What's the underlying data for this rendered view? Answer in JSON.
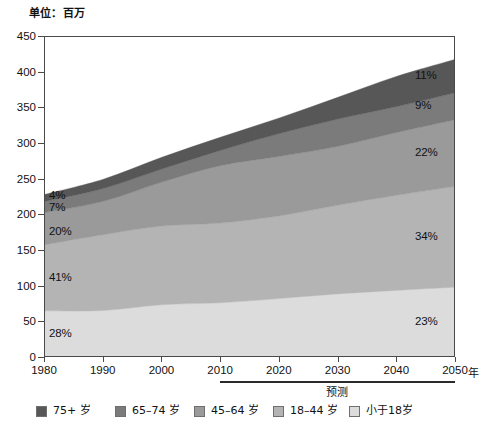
{
  "caption": {
    "unit_label": "单位：百万"
  },
  "axis": {
    "x_unit_suffix": "年",
    "y_ticks": [
      "0",
      "50",
      "100",
      "150",
      "200",
      "250",
      "300",
      "350",
      "400",
      "450"
    ],
    "x_ticks": [
      "1980",
      "1990",
      "2000",
      "2010",
      "2020",
      "2030",
      "2040",
      "2050"
    ]
  },
  "forecast": {
    "label": "预测",
    "start_year": 2010,
    "end_year": 2050
  },
  "annotations": {
    "left_1980": [
      {
        "text": "4%",
        "series": "75+ 岁"
      },
      {
        "text": "7%",
        "series": "65–74 岁"
      },
      {
        "text": "20%",
        "series": "45–64 岁"
      },
      {
        "text": "41%",
        "series": "18–44 岁"
      },
      {
        "text": "28%",
        "series": "小于18岁"
      }
    ],
    "right_2050": [
      {
        "text": "11%",
        "series": "75+ 岁"
      },
      {
        "text": "9%",
        "series": "65–74 岁"
      },
      {
        "text": "22%",
        "series": "45–64 岁"
      },
      {
        "text": "34%",
        "series": "18–44 岁"
      },
      {
        "text": "23%",
        "series": "小于18岁"
      }
    ]
  },
  "legend": {
    "items": [
      {
        "label": "75+ 岁",
        "color": "#575757",
        "wrap": false
      },
      {
        "label": "65–74 岁",
        "color": "#7b7b7b",
        "wrap": true
      },
      {
        "label": "45–64 岁",
        "color": "#9a9a9a",
        "wrap": true
      },
      {
        "label": "18–44 岁",
        "color": "#b4b4b4",
        "wrap": true
      },
      {
        "label": "小于18岁",
        "color": "#dcdcdc",
        "wrap": false
      }
    ]
  },
  "chart_data": {
    "type": "area",
    "title": "",
    "subtitle": "",
    "xlabel": "年",
    "ylabel": "单位：百万",
    "ylim": [
      0,
      450
    ],
    "xlim": [
      1980,
      2050
    ],
    "grid": false,
    "stacked": true,
    "legend_position": "bottom",
    "x": [
      1980,
      1990,
      2000,
      2010,
      2020,
      2030,
      2040,
      2050
    ],
    "series": [
      {
        "name": "小于18岁",
        "color": "#dcdcdc",
        "values": [
          63.7,
          64.2,
          72.3,
          75.0,
          81.0,
          87.5,
          92.5,
          97.0
        ]
      },
      {
        "name": "18–44 岁",
        "color": "#b4b4b4",
        "values": [
          93.3,
          107.0,
          111.0,
          112.5,
          116.5,
          125.0,
          134.0,
          142.0
        ]
      },
      {
        "name": "45–64 岁",
        "color": "#9a9a9a",
        "values": [
          45.5,
          47.0,
          62.0,
          81.0,
          84.0,
          83.0,
          88.5,
          94.0
        ]
      },
      {
        "name": "65–74 岁",
        "color": "#7b7b7b",
        "values": [
          15.6,
          18.1,
          18.4,
          21.5,
          32.0,
          38.5,
          36.5,
          38.0
        ]
      },
      {
        "name": "75+ 岁",
        "color": "#575757",
        "values": [
          9.9,
          13.1,
          16.6,
          18.5,
          22.0,
          30.5,
          42.5,
          47.0
        ]
      }
    ],
    "totals": [
      228.0,
      249.4,
      280.3,
      308.5,
      335.5,
      364.5,
      394.0,
      418.0
    ],
    "share_1980": {
      "小于18岁": 28,
      "18–44 岁": 41,
      "45–64 岁": 20,
      "65–74 岁": 7,
      "75+ 岁": 4
    },
    "share_2050": {
      "小于18岁": 23,
      "18–44 岁": 34,
      "45–64 岁": 22,
      "65–74 岁": 9,
      "75+ 岁": 11
    }
  }
}
